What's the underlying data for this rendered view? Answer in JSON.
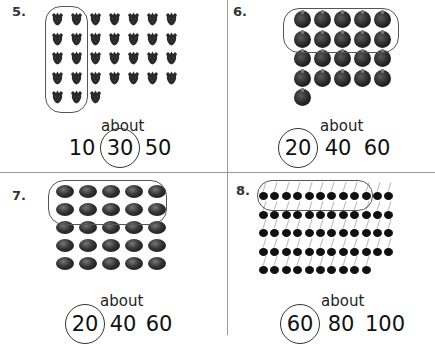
{
  "problems": [
    {
      "number": "5.",
      "object": "strawberry",
      "rows": [
        7,
        7,
        7,
        7,
        3
      ],
      "total_shown": 31,
      "group_label": "group of 10 circled",
      "about_label": "about",
      "choices": [
        "10",
        "30",
        "50"
      ],
      "circled_choice": "30"
    },
    {
      "number": "6.",
      "object": "apple",
      "rows": [
        5,
        5,
        5,
        5,
        1
      ],
      "total_shown": 21,
      "group_label": "group of 10 circled",
      "about_label": "about",
      "choices": [
        "20",
        "40",
        "60"
      ],
      "circled_choice": "20"
    },
    {
      "number": "7.",
      "object": "marble",
      "rows": [
        5,
        5,
        5,
        5,
        5
      ],
      "total_shown": 25,
      "group_label": "group of 10 circled",
      "about_label": "about",
      "choices": [
        "20",
        "40",
        "60"
      ],
      "circled_choice": "20"
    },
    {
      "number": "8.",
      "object": "cherry",
      "rows": [
        12,
        12,
        12,
        12,
        10
      ],
      "total_shown": 58,
      "group_label": "group of 10 circled",
      "about_label": "about",
      "choices": [
        "60",
        "80",
        "100"
      ],
      "circled_choice": "60"
    }
  ],
  "colors": {
    "divider": "#9a9a9a",
    "ink": "#222222",
    "object": "#1a1a1a"
  }
}
